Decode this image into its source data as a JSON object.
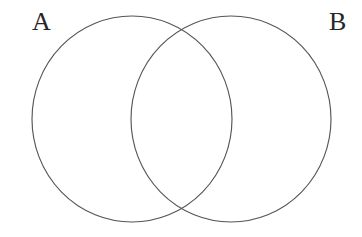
{
  "figure": {
    "type": "venn-2",
    "background_color": "#ffffff",
    "stroke_color": "#555555",
    "label_color": "#262626",
    "stroke_width": 1.15,
    "canvas": {
      "width": 362,
      "height": 237
    }
  },
  "sets": [
    {
      "id": "A",
      "label": "A",
      "label_position": "top-left",
      "center_x": 132,
      "center_y": 119,
      "radius_x": 100,
      "radius_y": 103,
      "fill": "none"
    },
    {
      "id": "B",
      "label": "B",
      "label_position": "top-right",
      "center_x": 231,
      "center_y": 119,
      "radius_x": 100,
      "radius_y": 103,
      "fill": "none"
    }
  ],
  "intersection": {
    "label": "",
    "upper_crossing_x": 181,
    "upper_crossing_y": 21,
    "lower_crossing_x": 181,
    "lower_crossing_y": 216
  }
}
